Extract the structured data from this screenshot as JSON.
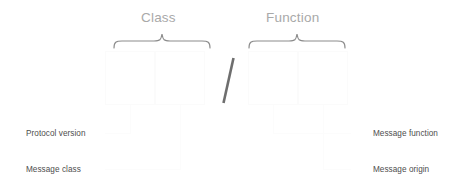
{
  "diagram": {
    "title_groups": [
      {
        "id": "class",
        "label": "Class"
      },
      {
        "id": "function",
        "label": "Function"
      }
    ],
    "separator": {
      "id": "slash",
      "label": "/"
    },
    "fields": [
      {
        "id": "protocol-version",
        "callout": "Protocol version",
        "group": "Class",
        "side": "left"
      },
      {
        "id": "message-class",
        "callout": "Message class",
        "group": "Class",
        "side": "left"
      },
      {
        "id": "message-function",
        "callout": "Message function",
        "group": "Function",
        "side": "right"
      },
      {
        "id": "message-origin",
        "callout": "Message origin",
        "group": "Function",
        "side": "right"
      }
    ],
    "colors": {
      "background": "#ffffff",
      "group_title": "#a9a9a9",
      "brace": "#8c8c8c",
      "slash": "#6e6e6e",
      "callout_text": "#4d4d4d",
      "box_outline": "#fbfbfb",
      "leader_line": "#fcfcfc"
    }
  }
}
